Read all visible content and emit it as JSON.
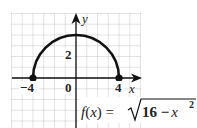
{
  "chart_data": {
    "type": "line",
    "title": "",
    "function_label": "f(x) = √(16 − x²)",
    "function_parts": {
      "lhs": "f(x) =",
      "radicand_const": "16 −",
      "radicand_var": "x",
      "exponent": "2"
    },
    "xlabel": "x",
    "ylabel": "y",
    "xlim": [
      -6,
      6
    ],
    "ylim": [
      -5,
      6
    ],
    "grid": true,
    "tick_labels": {
      "x": [
        {
          "value": -4,
          "label": "−4"
        },
        {
          "value": 0,
          "label": "0"
        },
        {
          "value": 4,
          "label": "4"
        }
      ],
      "y": [
        {
          "value": 2,
          "label": "2"
        }
      ]
    },
    "series": [
      {
        "name": "f(x) = sqrt(16 - x^2)",
        "shape": "upper semicircle, radius 4, centered at origin",
        "x": [
          -4,
          -3,
          -2,
          -1,
          0,
          1,
          2,
          3,
          4
        ],
        "y": [
          0,
          2.65,
          3.46,
          3.87,
          4,
          3.87,
          3.46,
          2.65,
          0
        ]
      }
    ],
    "endpoints": [
      {
        "x": -4,
        "y": 0,
        "style": "closed"
      },
      {
        "x": 4,
        "y": 0,
        "style": "closed"
      }
    ]
  },
  "colors": {
    "curve": "#111111",
    "grid": "#b8b8b8",
    "axes": "#111111",
    "background": "#ffffff"
  }
}
